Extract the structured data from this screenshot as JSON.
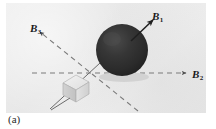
{
  "figure": {
    "caption": "(a)",
    "panel": {
      "background_color": "#ebebeb",
      "width": 200,
      "height": 110
    },
    "objects": [
      {
        "name": "sphere",
        "description": "dark solid sphere",
        "color": "#2e2e2e",
        "center_x": 116,
        "center_y": 47,
        "radius": 26
      },
      {
        "name": "cube",
        "description": "light gray cube crystal",
        "color": "#d8d8d8",
        "center_x": 66,
        "center_y": 86
      }
    ],
    "vectors": [
      {
        "id": "B1",
        "label": "B",
        "subscript": "1",
        "style": "solid",
        "direction": "up-right",
        "from_x": 122,
        "from_y": 40,
        "to_x": 146,
        "to_y": 17
      },
      {
        "id": "B2",
        "label": "B",
        "subscript": "2",
        "style": "dashed",
        "direction": "right",
        "from_x": 28,
        "from_y": 70,
        "to_x": 182,
        "to_y": 70
      },
      {
        "id": "B3",
        "label": "B",
        "subscript": "3",
        "style": "dashed",
        "direction": "up-left",
        "from_x": 128,
        "from_y": 105,
        "to_x": 32,
        "to_y": 28
      }
    ],
    "labels": {
      "b1": "B",
      "b1_sub": "1",
      "b2": "B",
      "b2_sub": "2",
      "b3": "B",
      "b3_sub": "3"
    },
    "colors": {
      "line": "#6e6e6e",
      "arrow": "#1f1f1f",
      "sphere": "#2e2e2e",
      "cube": "#d6d6d6",
      "background": "#ebebeb"
    }
  }
}
